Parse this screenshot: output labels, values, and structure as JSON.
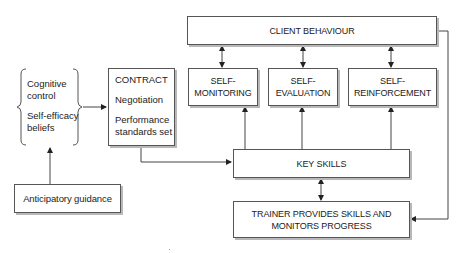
{
  "diagram": {
    "nodes": {
      "client_behaviour": {
        "lines": [
          "CLIENT BEHAVIOUR"
        ]
      },
      "self_monitoring": {
        "lines": [
          "SELF-",
          "MONITORING"
        ]
      },
      "self_evaluation": {
        "lines": [
          "SELF-",
          "EVALUATION"
        ]
      },
      "self_reinforcement": {
        "lines": [
          "SELF-",
          "REINFORCEMENT"
        ]
      },
      "contract": {
        "items": [
          "CONTRACT",
          "Negotiation",
          "Performance",
          "standards set"
        ]
      },
      "beliefs_group": {
        "items": [
          "Cognitive",
          "control",
          "Self-efficacy",
          "beliefs"
        ]
      },
      "anticipatory_guidance": {
        "lines": [
          "Anticipatory guidance"
        ]
      },
      "key_skills": {
        "lines": [
          "KEY SKILLS"
        ]
      },
      "trainer": {
        "lines": [
          "TRAINER PROVIDES SKILLS AND",
          "MONITORS PROGRESS"
        ]
      }
    },
    "edges": [
      {
        "from": "client_behaviour",
        "to": "self_monitoring",
        "type": "bidirectional"
      },
      {
        "from": "client_behaviour",
        "to": "self_evaluation",
        "type": "bidirectional"
      },
      {
        "from": "client_behaviour",
        "to": "self_reinforcement",
        "type": "bidirectional"
      },
      {
        "from": "key_skills",
        "to": "self_monitoring",
        "type": "arrow"
      },
      {
        "from": "key_skills",
        "to": "self_evaluation",
        "type": "arrow"
      },
      {
        "from": "key_skills",
        "to": "self_reinforcement",
        "type": "arrow"
      },
      {
        "from": "beliefs_group",
        "to": "contract",
        "type": "arrow"
      },
      {
        "from": "anticipatory_guidance",
        "to": "beliefs_group",
        "type": "arrow"
      },
      {
        "from": "contract",
        "to": "key_skills",
        "type": "arrow"
      },
      {
        "from": "key_skills",
        "to": "trainer",
        "type": "bidirectional"
      },
      {
        "from": "client_behaviour",
        "to": "trainer",
        "type": "arrow"
      }
    ],
    "colors": {
      "line": "#444444",
      "border": "#555555",
      "shadow": "#b8b8b8"
    }
  }
}
